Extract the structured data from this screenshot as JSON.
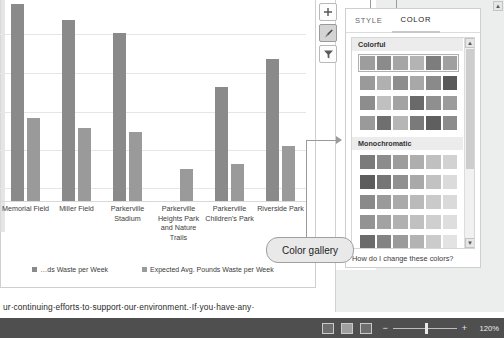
{
  "document": {
    "body_text": "ur·continuing·efforts·to·support·our·environment.·If·you·have·any·"
  },
  "chart_buttons": [
    {
      "name": "chart-elements-button",
      "icon": "plus-icon",
      "glyph": "✚",
      "active": false
    },
    {
      "name": "chart-styles-button",
      "icon": "paintbrush-icon",
      "glyph": "✐",
      "active": true
    },
    {
      "name": "chart-filters-button",
      "icon": "funnel-icon",
      "glyph": "▼",
      "active": false
    }
  ],
  "pane": {
    "tabs": [
      {
        "label": "STYLE",
        "selected": false
      },
      {
        "label": "COLOR",
        "selected": true
      }
    ],
    "sections": [
      {
        "title": "Colorful",
        "rows": [
          {
            "selected": true,
            "colors": [
              "#9d9d9d",
              "#8b8b8b",
              "#a5a5a5",
              "#b4b4b4",
              "#7d7d7d",
              "#a0a0a0"
            ]
          },
          {
            "selected": false,
            "colors": [
              "#9a9a9a",
              "#b0b0b0",
              "#8e8e8e",
              "#a8a8a8",
              "#8a8a8a",
              "#5a5a5a"
            ]
          },
          {
            "selected": false,
            "colors": [
              "#8d8d8d",
              "#c0c0c0",
              "#a3a3a3",
              "#6a6a6a",
              "#8f8f8f",
              "#9c9c9c"
            ]
          },
          {
            "selected": false,
            "colors": [
              "#9a9a9a",
              "#6f6f6f",
              "#b6b6b6",
              "#7a7a7a",
              "#5f5f5f",
              "#8c8c8c"
            ]
          }
        ]
      },
      {
        "title": "Monochromatic",
        "rows": [
          {
            "selected": false,
            "colors": [
              "#7b7b7b",
              "#8c8c8c",
              "#9d9d9d",
              "#aeaeae",
              "#c0c0c0",
              "#d2d2d2"
            ]
          },
          {
            "selected": false,
            "colors": [
              "#5d5d5d",
              "#767676",
              "#909090",
              "#a9a9a9",
              "#c2c2c2",
              "#dbdbdb"
            ]
          },
          {
            "selected": false,
            "colors": [
              "#8a8a8a",
              "#9a9a9a",
              "#aaaaaa",
              "#bababa",
              "#cacaca",
              "#dadada"
            ]
          },
          {
            "selected": false,
            "colors": [
              "#939393",
              "#a2a2a2",
              "#b1b1b1",
              "#c0c0c0",
              "#cfcfcf",
              "#dedede"
            ]
          },
          {
            "selected": false,
            "colors": [
              "#6b6b6b",
              "#838383",
              "#9b9b9b",
              "#b3b3b3",
              "#cbcbcb",
              "#e3e3e3"
            ]
          }
        ]
      }
    ],
    "help_link": "How do I change these colors?"
  },
  "callout": {
    "label": "Color gallery"
  },
  "status_bar": {
    "zoom_label": "120%",
    "zoom_minus": "−",
    "zoom_plus": "+",
    "views": [
      {
        "name": "read-mode-view-button",
        "active": false
      },
      {
        "name": "print-layout-view-button",
        "active": true
      },
      {
        "name": "web-layout-view-button",
        "active": false
      }
    ]
  },
  "chart_data": {
    "type": "bar",
    "title": "",
    "xlabel": "",
    "ylabel": "",
    "grid": true,
    "legend_position": "bottom",
    "categories": [
      "Memorial Field",
      "Miller Field",
      "Parkerville Stadium",
      "Parkerville Heights Park and Nature Trails",
      "Parkerville Children's Park",
      "Riverside Park"
    ],
    "series": [
      {
        "name": "…ds Waste per Week",
        "values": [
          100,
          92,
          85,
          0,
          58,
          72
        ]
      },
      {
        "name": "Expected Avg. Pounds Waste per Week",
        "values": [
          42,
          37,
          35,
          16,
          19,
          28
        ]
      }
    ],
    "ylim": [
      0,
      105
    ],
    "gridline_values": [
      100,
      80,
      60,
      40,
      20
    ]
  }
}
